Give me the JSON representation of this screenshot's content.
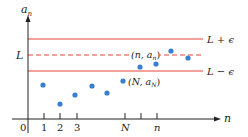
{
  "diagram": {
    "y_axis_label": "a",
    "y_axis_sub": "n",
    "x_axis_label": "n",
    "origin_label": "0",
    "L_label": "L",
    "upper_label": "L + ϵ",
    "lower_label": "L − ϵ",
    "tick_labels": [
      "1",
      "2",
      "3",
      "N",
      "n"
    ],
    "point_N_label": "(N, a",
    "point_N_sub": "N",
    "point_n_label": "(n, a",
    "point_n_sub": "n",
    "colors": {
      "band_lines": "#e8453c",
      "points": "#3a7fcf",
      "axes": "#222222"
    },
    "points": [
      {
        "x": 43,
        "y": 85
      },
      {
        "x": 60,
        "y": 104
      },
      {
        "x": 75,
        "y": 95
      },
      {
        "x": 92,
        "y": 86
      },
      {
        "x": 107,
        "y": 93
      },
      {
        "x": 123,
        "y": 81
      },
      {
        "x": 140,
        "y": 67
      },
      {
        "x": 156,
        "y": 64
      },
      {
        "x": 171,
        "y": 51
      },
      {
        "x": 188,
        "y": 58
      }
    ]
  }
}
